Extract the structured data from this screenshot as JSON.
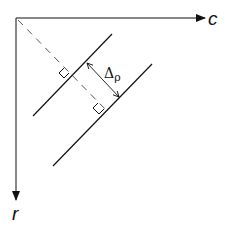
{
  "diagram": {
    "axes": {
      "horizontal_label": "c",
      "vertical_label": "r"
    },
    "annotation": {
      "symbol": "Δ",
      "subscript": "ρ"
    },
    "elements": [
      "origin corner",
      "horizontal axis with arrow labeled c",
      "vertical axis with arrow labeled r",
      "dashed line from origin perpendicular to parallel lines",
      "two parallel diagonal lines",
      "right-angle marks at intersections",
      "double-headed arrow indicating spacing Δρ"
    ],
    "colors": {
      "stroke": "#111111",
      "dashed": "#555555",
      "background": "#ffffff"
    }
  }
}
